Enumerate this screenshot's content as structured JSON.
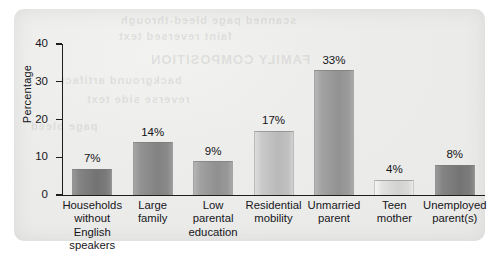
{
  "chart_data": {
    "type": "bar",
    "title": "",
    "xlabel": "",
    "ylabel": "Percentage",
    "ylim": [
      0,
      40
    ],
    "yticks": [
      0,
      10,
      20,
      30,
      40
    ],
    "ytick_labels": [
      "0",
      "10",
      "20",
      "30",
      "40"
    ],
    "grid": false,
    "legend": "none",
    "value_labels_shown": true,
    "categories": [
      "Households\nwithout English\nspeakers",
      "Large\nfamily",
      "Low\nparental\neducation",
      "Residential\nmobility",
      "Unmarried\nparent",
      "Teen\nmother",
      "Unemployed\nparent(s)"
    ],
    "values": [
      7,
      14,
      9,
      17,
      33,
      4,
      8
    ],
    "value_labels": [
      "7%",
      "14%",
      "9%",
      "17%",
      "33%",
      "4%",
      "8%"
    ],
    "bar_colors": [
      "#7d7d7d",
      "#8c8c8c",
      "#9a9a9a",
      "#c3c3c3",
      "#9c9c9c",
      "#dcdcda",
      "#7e7e7e"
    ]
  },
  "axes": {
    "y_title": "Percentage",
    "ticks": [
      {
        "label": "40",
        "value": 40
      },
      {
        "label": "30",
        "value": 30
      },
      {
        "label": "20",
        "value": 20
      },
      {
        "label": "10",
        "value": 10
      },
      {
        "label": "0",
        "value": 0
      }
    ]
  },
  "ghost_text": {
    "line1": "scanned page bleed-through",
    "line2": "faint reversed text",
    "line3": "FAMILY COMPOSITION",
    "line4": "background artifact",
    "line5": "reverse side text",
    "line6": "page bleed"
  }
}
